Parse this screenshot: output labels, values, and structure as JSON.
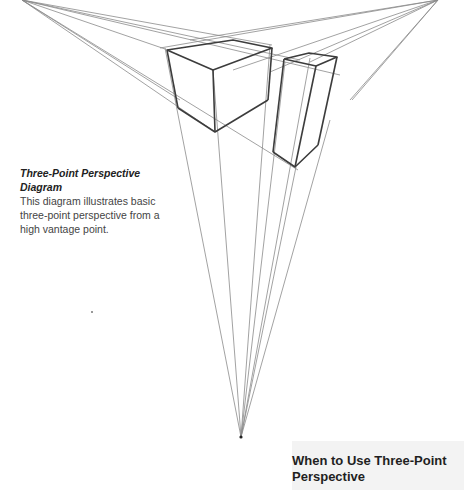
{
  "caption": {
    "title": "Three-Point Perspective Diagram",
    "body": "This diagram illustrates basic three-point perspective from a high vantage point."
  },
  "panel": {
    "heading": "When to Use Three-Point Perspective"
  },
  "diagram": {
    "type": "three-point-perspective",
    "vanishing_points": {
      "left": [
        22,
        0
      ],
      "right": [
        438,
        0
      ],
      "bottom": [
        241,
        437
      ]
    },
    "stroke_color": "#555555"
  }
}
